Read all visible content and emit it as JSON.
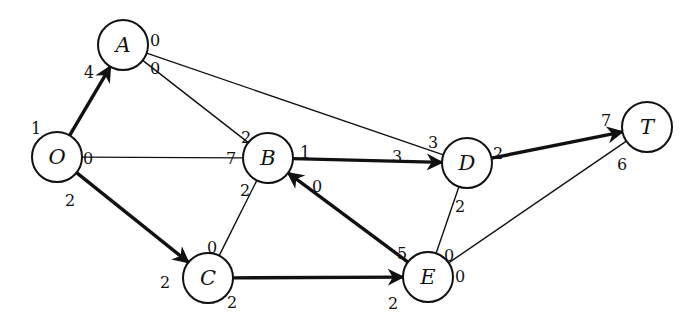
{
  "diagram": {
    "type": "flow-network",
    "colors": {
      "stroke": "#111111",
      "background": "#ffffff"
    },
    "nodes": [
      {
        "id": "O",
        "label": "O",
        "x": 57,
        "y": 157
      },
      {
        "id": "A",
        "label": "A",
        "x": 123,
        "y": 45
      },
      {
        "id": "B",
        "label": "B",
        "x": 268,
        "y": 158
      },
      {
        "id": "C",
        "label": "C",
        "x": 208,
        "y": 278
      },
      {
        "id": "D",
        "label": "D",
        "x": 467,
        "y": 163
      },
      {
        "id": "E",
        "label": "E",
        "x": 428,
        "y": 277
      },
      {
        "id": "T",
        "label": "T",
        "x": 647,
        "y": 127
      }
    ],
    "edges": [
      {
        "from": "O",
        "to": "A",
        "bold": true,
        "arrow": "A",
        "from_label": "1",
        "to_label": "4"
      },
      {
        "from": "O",
        "to": "B",
        "bold": false,
        "arrow": null,
        "from_label": "0",
        "to_label": "7"
      },
      {
        "from": "O",
        "to": "C",
        "bold": true,
        "arrow": "C",
        "from_label": "2",
        "to_label": "2"
      },
      {
        "from": "A",
        "to": "B",
        "bold": false,
        "arrow": null,
        "from_label": "0",
        "to_label": "2"
      },
      {
        "from": "A",
        "to": "D",
        "bold": false,
        "arrow": null,
        "from_label": "0",
        "to_label": "3"
      },
      {
        "from": "B",
        "to": "C",
        "bold": false,
        "arrow": null,
        "from_label": "2",
        "to_label": "0"
      },
      {
        "from": "B",
        "to": "D",
        "bold": true,
        "arrow": "D",
        "from_label": "1",
        "to_label": "3"
      },
      {
        "from": "E",
        "to": "B",
        "bold": true,
        "arrow": "B",
        "from_label": "5",
        "to_label": "0"
      },
      {
        "from": "C",
        "to": "E",
        "bold": true,
        "arrow": "E",
        "from_label": "2",
        "to_label": "2"
      },
      {
        "from": "D",
        "to": "E",
        "bold": false,
        "arrow": null,
        "from_label": "2",
        "to_label": "0"
      },
      {
        "from": "D",
        "to": "T",
        "bold": true,
        "arrow": "T",
        "from_label": "2",
        "to_label": "7"
      },
      {
        "from": "E",
        "to": "T",
        "bold": false,
        "arrow": null,
        "from_label": "0",
        "to_label": "6"
      }
    ],
    "label_positions": [
      {
        "text": "1",
        "x": 36,
        "y": 128
      },
      {
        "text": "4",
        "x": 89,
        "y": 72
      },
      {
        "text": "0",
        "x": 88,
        "y": 158
      },
      {
        "text": "7",
        "x": 231,
        "y": 158
      },
      {
        "text": "2",
        "x": 70,
        "y": 200
      },
      {
        "text": "2",
        "x": 165,
        "y": 282
      },
      {
        "text": "0",
        "x": 155,
        "y": 40
      },
      {
        "text": "0",
        "x": 155,
        "y": 68
      },
      {
        "text": "2",
        "x": 246,
        "y": 137
      },
      {
        "text": "3",
        "x": 433,
        "y": 142
      },
      {
        "text": "2",
        "x": 245,
        "y": 190
      },
      {
        "text": "0",
        "x": 212,
        "y": 247
      },
      {
        "text": "1",
        "x": 305,
        "y": 152
      },
      {
        "text": "3",
        "x": 397,
        "y": 156
      },
      {
        "text": "0",
        "x": 317,
        "y": 186
      },
      {
        "text": "5",
        "x": 402,
        "y": 253
      },
      {
        "text": "2",
        "x": 232,
        "y": 302
      },
      {
        "text": "2",
        "x": 393,
        "y": 303
      },
      {
        "text": "2",
        "x": 460,
        "y": 206
      },
      {
        "text": "0",
        "x": 449,
        "y": 255
      },
      {
        "text": "2",
        "x": 498,
        "y": 153
      },
      {
        "text": "7",
        "x": 606,
        "y": 120
      },
      {
        "text": "0",
        "x": 460,
        "y": 276
      },
      {
        "text": "6",
        "x": 622,
        "y": 164
      }
    ]
  }
}
